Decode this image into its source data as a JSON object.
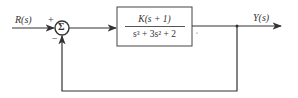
{
  "diagram": {
    "type": "block-diagram",
    "input_label": "R(s)",
    "output_label": "Y(s)",
    "summing_junction": {
      "symbol": "Σ",
      "input_sign": "+",
      "feedback_sign": "−"
    },
    "transfer_function": {
      "numerator": "K(s + 1)",
      "denominator": "s³ + 3s² + 2"
    },
    "feedback": "unity negative feedback"
  }
}
